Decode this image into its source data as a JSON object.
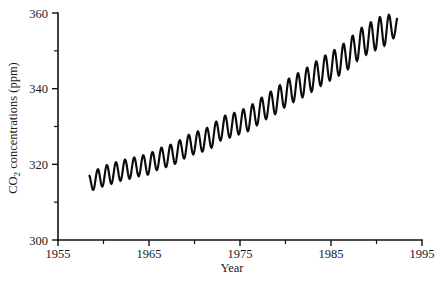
{
  "chart_data": {
    "type": "line",
    "title": "",
    "xlabel": "Year",
    "ylabel_main": "CO",
    "ylabel_sub": "2",
    "ylabel_rest": " concentrations (ppm)",
    "ylabel_full": "CO2 concentrations (ppm)",
    "xlim": [
      1955,
      1995
    ],
    "ylim": [
      300,
      360
    ],
    "grid": false,
    "legend": null,
    "x_ticks_major": [
      1955,
      1965,
      1975,
      1985,
      1995
    ],
    "x_ticks_major_labels": [
      "1955",
      "1965",
      "1975",
      "1985",
      "1995"
    ],
    "x_ticks_minor": [
      1960,
      1970,
      1980,
      1990
    ],
    "y_ticks_major": [
      300,
      320,
      340,
      360
    ],
    "y_ticks_major_labels": [
      "300",
      "320",
      "340",
      "360"
    ],
    "y_ticks_minor": [
      310,
      330,
      350
    ],
    "series_name": "Mauna Loa atmospheric CO2 (Keeling curve)",
    "line_color": "#0b0b0b",
    "annual_points": [
      {
        "year": 1958.4,
        "trend": 315.0,
        "min": 313.2,
        "max": 317.6
      },
      {
        "year": 1959.0,
        "trend": 315.8,
        "min": 313.4,
        "max": 318.2
      },
      {
        "year": 1960.0,
        "trend": 316.9,
        "min": 314.1,
        "max": 319.4
      },
      {
        "year": 1961.0,
        "trend": 317.6,
        "min": 314.8,
        "max": 320.1
      },
      {
        "year": 1962.0,
        "trend": 318.4,
        "min": 315.6,
        "max": 320.9
      },
      {
        "year": 1963.0,
        "trend": 318.9,
        "min": 316.1,
        "max": 321.4
      },
      {
        "year": 1964.0,
        "trend": 319.6,
        "min": 316.8,
        "max": 322.1
      },
      {
        "year": 1965.0,
        "trend": 320.0,
        "min": 317.2,
        "max": 322.6
      },
      {
        "year": 1966.0,
        "trend": 321.4,
        "min": 318.5,
        "max": 324.0
      },
      {
        "year": 1967.0,
        "trend": 322.1,
        "min": 319.2,
        "max": 324.7
      },
      {
        "year": 1968.0,
        "trend": 323.0,
        "min": 320.1,
        "max": 325.6
      },
      {
        "year": 1969.0,
        "trend": 324.6,
        "min": 321.6,
        "max": 327.3
      },
      {
        "year": 1970.0,
        "trend": 325.6,
        "min": 322.6,
        "max": 328.3
      },
      {
        "year": 1971.0,
        "trend": 326.3,
        "min": 323.3,
        "max": 329.0
      },
      {
        "year": 1972.0,
        "trend": 327.5,
        "min": 324.4,
        "max": 330.3
      },
      {
        "year": 1973.0,
        "trend": 329.6,
        "min": 326.4,
        "max": 332.5
      },
      {
        "year": 1974.0,
        "trend": 330.2,
        "min": 327.0,
        "max": 333.1
      },
      {
        "year": 1975.0,
        "trend": 331.1,
        "min": 327.9,
        "max": 334.1
      },
      {
        "year": 1976.0,
        "trend": 332.0,
        "min": 328.7,
        "max": 335.0
      },
      {
        "year": 1977.0,
        "trend": 333.8,
        "min": 330.4,
        "max": 336.9
      },
      {
        "year": 1978.0,
        "trend": 335.4,
        "min": 332.0,
        "max": 338.5
      },
      {
        "year": 1979.0,
        "trend": 336.8,
        "min": 333.3,
        "max": 340.0
      },
      {
        "year": 1980.0,
        "trend": 338.7,
        "min": 335.1,
        "max": 342.0
      },
      {
        "year": 1981.0,
        "trend": 340.1,
        "min": 336.5,
        "max": 343.4
      },
      {
        "year": 1982.0,
        "trend": 341.4,
        "min": 337.7,
        "max": 344.8
      },
      {
        "year": 1983.0,
        "trend": 343.0,
        "min": 339.3,
        "max": 346.5
      },
      {
        "year": 1984.0,
        "trend": 344.6,
        "min": 340.8,
        "max": 348.1
      },
      {
        "year": 1985.0,
        "trend": 346.0,
        "min": 342.2,
        "max": 349.6
      },
      {
        "year": 1986.0,
        "trend": 347.4,
        "min": 343.5,
        "max": 351.0
      },
      {
        "year": 1987.0,
        "trend": 349.2,
        "min": 345.2,
        "max": 352.9
      },
      {
        "year": 1988.0,
        "trend": 351.6,
        "min": 347.5,
        "max": 355.4
      },
      {
        "year": 1989.0,
        "trend": 353.1,
        "min": 349.0,
        "max": 356.9
      },
      {
        "year": 1990.0,
        "trend": 354.4,
        "min": 350.2,
        "max": 358.3
      },
      {
        "year": 1991.0,
        "trend": 355.6,
        "min": 351.4,
        "max": 359.6
      },
      {
        "year": 1992.0,
        "trend": 356.4,
        "min": 352.2,
        "max": 357.8
      }
    ],
    "seasonal_cycle_peak_month": "May",
    "seasonal_cycle_trough_month": "October",
    "data_start_year": 1958.4,
    "data_end_year": 1992.3,
    "data_start_value": 315.0,
    "data_end_value": 356.4
  },
  "geometry": {
    "plot_left": 58,
    "plot_right": 422,
    "plot_top": 13,
    "plot_bottom": 240
  }
}
